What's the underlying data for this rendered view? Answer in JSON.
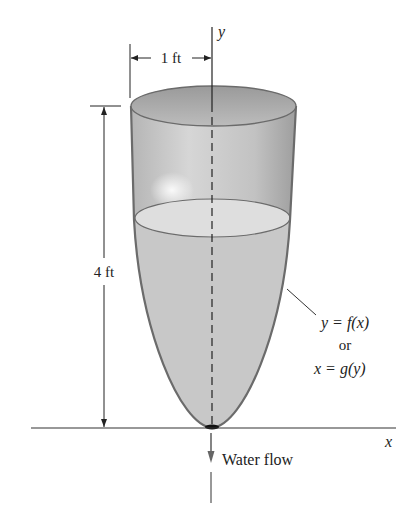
{
  "diagram": {
    "axes": {
      "x_label": "x",
      "y_label": "y"
    },
    "dimensions": {
      "radius_label": "1 ft",
      "height_label": "4 ft"
    },
    "curve_labels": {
      "line1": "y = f(x)",
      "line2": "or",
      "line3": "x = g(y)"
    },
    "flow_label": "Water flow",
    "colors": {
      "tank_outline": "#6b6b6b",
      "tank_fill": "#bdbdbd",
      "water_fill": "#c9c9c9",
      "water_surface": "#dcdcdc",
      "rim_inner": "#a8a8a8",
      "line": "#222222"
    }
  }
}
